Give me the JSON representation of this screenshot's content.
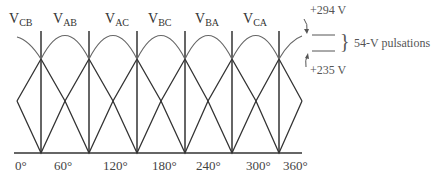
{
  "diagram": {
    "phase_labels": [
      {
        "main": "V",
        "sub": "CB"
      },
      {
        "main": "V",
        "sub": "AB"
      },
      {
        "main": "V",
        "sub": "AC"
      },
      {
        "main": "V",
        "sub": "BC"
      },
      {
        "main": "V",
        "sub": "BA"
      },
      {
        "main": "V",
        "sub": "CA"
      }
    ],
    "x_ticks": [
      "0°",
      "60°",
      "120°",
      "180°",
      "240°",
      "300°",
      "360°"
    ],
    "annotations": {
      "peak": "+294 V",
      "valley": "+235 V",
      "pulsation": "54-V pulsations",
      "brace": "}"
    },
    "colors": {
      "lines": "#333333",
      "arcs": "#666666"
    }
  }
}
